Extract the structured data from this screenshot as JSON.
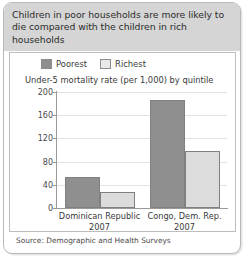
{
  "figure": {
    "title": "Children in poor households are more likely to die compared with the children in rich households",
    "source": "Source: Demographic and Health Surveys"
  },
  "colors": {
    "poorest": "#8f8f8f",
    "richest": "#dcdcdc",
    "bar_border": "#808080",
    "title_band": "#d5d5d5",
    "gridline": "#e2e2e2",
    "axis": "#9a9a9a",
    "frame_border": "#b9b9b9"
  },
  "chart_data": {
    "type": "bar",
    "title": "Children in poor households are more likely to die compared with the children in rich households",
    "subtitle": "Under-5 mortality rate (per 1,000) by quintile",
    "xlabel": "",
    "ylabel": "",
    "ylim": [
      0,
      200
    ],
    "yticks": [
      0,
      40,
      80,
      120,
      160,
      200
    ],
    "ytick_labels": [
      "0",
      "40",
      "80",
      "120",
      "160",
      "200"
    ],
    "grid": true,
    "legend_position": "top-left",
    "categories": [
      "Dominican Republic",
      "Congo, Dem. Rep."
    ],
    "category_years": [
      "2007",
      "2007"
    ],
    "series": [
      {
        "name": "Poorest",
        "values": [
          53,
          186
        ]
      },
      {
        "name": "Richest",
        "values": [
          28,
          98
        ]
      }
    ]
  }
}
